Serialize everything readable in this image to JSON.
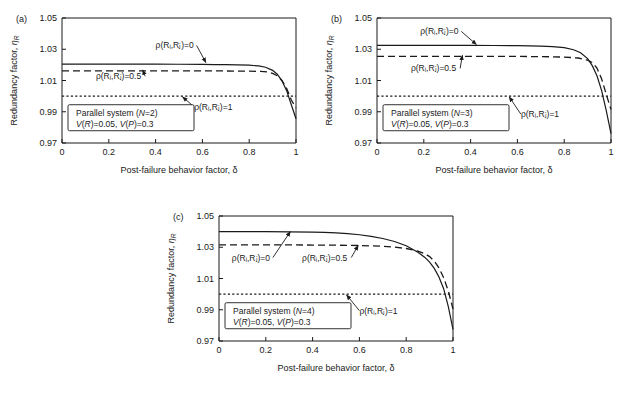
{
  "figure": {
    "background": "#ffffff",
    "ink": "#1a1a1a"
  },
  "axes": {
    "xlabel": "Post-failure behavior factor, δ",
    "ylabel_main": "Redundancy factor, ",
    "ylabel_symbol": "η",
    "ylabel_subscript": "R",
    "xticks": [
      "0",
      "0.2",
      "0.4",
      "0.6",
      "0.8",
      "1"
    ],
    "xtick_values": [
      0,
      0.2,
      0.4,
      0.6,
      0.8,
      1
    ],
    "yticks": [
      "0.97",
      "0.99",
      "1.01",
      "1.03",
      "1.05"
    ],
    "ytick_values": [
      0.97,
      0.99,
      1.01,
      1.03,
      1.05
    ],
    "xlim": [
      0,
      1
    ],
    "ylim": [
      0.97,
      1.05
    ]
  },
  "labels": {
    "rho0": "ρ(Rᵢ,Rⱼ)=0",
    "rho05": "ρ(Rᵢ,Rⱼ)=0.5",
    "rho1": "ρ(Rᵢ,Rⱼ)=1"
  },
  "chart_data": [
    {
      "type": "line",
      "panel": "(a)",
      "title": "",
      "xlabel": "Post-failure behavior factor, δ",
      "ylabel": "Redundancy factor, ηR",
      "xlim": [
        0,
        1
      ],
      "ylim": [
        0.97,
        1.05
      ],
      "grid": false,
      "legend_position": "lower-left-box",
      "legend_lines": [
        "Parallel system (N=2)",
        "V(R)=0.05,  V(P)=0.3"
      ],
      "legend_line1_pre": "Parallel system (",
      "legend_line1_var": "N",
      "legend_line1_post": "=2)",
      "legend_line2_a": "V",
      "legend_line2_b": "(",
      "legend_line2_c": "R",
      "legend_line2_d": ")=0.05,  ",
      "legend_line2_e": "V",
      "legend_line2_f": "(",
      "legend_line2_g": "P",
      "legend_line2_h": ")=0.3",
      "series": [
        {
          "name": "ρ(Ri,Rj)=0",
          "style": "solid",
          "x": [
            0,
            0.1,
            0.2,
            0.3,
            0.4,
            0.5,
            0.6,
            0.65,
            0.7,
            0.75,
            0.8,
            0.84,
            0.87,
            0.9,
            0.92,
            0.94,
            0.96,
            0.98,
            1.0
          ],
          "y": [
            1.0205,
            1.0205,
            1.0205,
            1.0205,
            1.0205,
            1.0204,
            1.0203,
            1.0202,
            1.0201,
            1.02,
            1.0198,
            1.0193,
            1.0185,
            1.0165,
            1.014,
            1.0098,
            1.0035,
            0.9945,
            0.9855
          ]
        },
        {
          "name": "ρ(Ri,Rj)=0.5",
          "style": "dashed",
          "x": [
            0,
            0.1,
            0.2,
            0.3,
            0.4,
            0.5,
            0.6,
            0.7,
            0.8,
            0.85,
            0.88,
            0.9,
            0.92,
            0.94,
            0.96,
            0.98,
            1.0
          ],
          "y": [
            1.0162,
            1.0162,
            1.0162,
            1.0162,
            1.0162,
            1.0162,
            1.0161,
            1.0161,
            1.016,
            1.0158,
            1.0154,
            1.0146,
            1.013,
            1.01,
            1.005,
            0.9975,
            0.9925
          ]
        },
        {
          "name": "ρ(Ri,Rj)=1",
          "style": "dotted",
          "x": [
            0,
            1
          ],
          "y": [
            1.0,
            1.0
          ]
        }
      ],
      "annotations": [
        {
          "text": "ρ(Rᵢ,Rⱼ)=0",
          "tx": 0.4,
          "ty": 1.0305,
          "ax": 0.615,
          "ay": 1.0215
        },
        {
          "text": "ρ(Rᵢ,Rⱼ)=0.5",
          "tx": 0.145,
          "ty": 1.0108,
          "ax": 0.345,
          "ay": 1.0168
        },
        {
          "text": "ρ(Rᵢ,Rⱼ)=1",
          "tx": 0.565,
          "ty": 0.9912,
          "ax": 0.515,
          "ay": 0.9995
        }
      ]
    },
    {
      "type": "line",
      "panel": "(b)",
      "title": "",
      "xlabel": "Post-failure behavior factor, δ",
      "ylabel": "Redundancy factor, ηR",
      "xlim": [
        0,
        1
      ],
      "ylim": [
        0.97,
        1.05
      ],
      "grid": false,
      "legend_position": "lower-left-box",
      "legend_lines": [
        "Parallel system (N=3)",
        "V(R)=0.05,  V(P)=0.3"
      ],
      "legend_line1_pre": "Parallel system (",
      "legend_line1_var": "N",
      "legend_line1_post": "=3)",
      "legend_line2_a": "V",
      "legend_line2_b": "(",
      "legend_line2_c": "R",
      "legend_line2_d": ")=0.05,  ",
      "legend_line2_e": "V",
      "legend_line2_f": "(",
      "legend_line2_g": "P",
      "legend_line2_h": ")=0.3",
      "series": [
        {
          "name": "ρ(Ri,Rj)=0",
          "style": "solid",
          "x": [
            0,
            0.1,
            0.2,
            0.3,
            0.4,
            0.5,
            0.6,
            0.7,
            0.75,
            0.8,
            0.84,
            0.87,
            0.9,
            0.92,
            0.94,
            0.96,
            0.98,
            1.0
          ],
          "y": [
            1.0325,
            1.0325,
            1.0325,
            1.0325,
            1.0325,
            1.0324,
            1.0323,
            1.032,
            1.0317,
            1.031,
            1.0297,
            1.0278,
            1.024,
            1.0195,
            1.013,
            1.0035,
            0.9905,
            0.976
          ]
        },
        {
          "name": "ρ(Ri,Rj)=0.5",
          "style": "dashed",
          "x": [
            0,
            0.1,
            0.2,
            0.3,
            0.4,
            0.5,
            0.6,
            0.7,
            0.8,
            0.86,
            0.9,
            0.92,
            0.94,
            0.96,
            0.98,
            1.0
          ],
          "y": [
            1.0255,
            1.0255,
            1.0255,
            1.0255,
            1.0255,
            1.0255,
            1.0254,
            1.0253,
            1.025,
            1.0244,
            1.023,
            1.0215,
            1.018,
            1.011,
            1.001,
            0.9915
          ]
        },
        {
          "name": "ρ(Ri,Rj)=1",
          "style": "dotted",
          "x": [
            0,
            1
          ],
          "y": [
            1.0,
            1.0
          ]
        }
      ],
      "annotations": [
        {
          "text": "ρ(Rᵢ,Rⱼ)=0",
          "tx": 0.185,
          "ty": 1.0395,
          "ax": 0.425,
          "ay": 1.033
        },
        {
          "text": "ρ(Rᵢ,Rⱼ)=0.5",
          "tx": 0.145,
          "ty": 1.0158,
          "ax": 0.365,
          "ay": 1.0262
        },
        {
          "text": "ρ(Rᵢ,Rⱼ)=1",
          "tx": 0.615,
          "ty": 0.9865,
          "ax": 0.565,
          "ay": 0.9995
        }
      ]
    },
    {
      "type": "line",
      "panel": "(c)",
      "title": "",
      "xlabel": "Post-failure behavior factor, δ",
      "ylabel": "Redundancy factor, ηR",
      "xlim": [
        0,
        1
      ],
      "ylim": [
        0.97,
        1.05
      ],
      "grid": false,
      "legend_position": "lower-left-box",
      "legend_lines": [
        "Parallel system (N=4)",
        "V(R)=0.05,  V(P)=0.3"
      ],
      "legend_line1_pre": "Parallel system (",
      "legend_line1_var": "N",
      "legend_line1_post": "=4)",
      "legend_line2_a": "V",
      "legend_line2_b": "(",
      "legend_line2_c": "R",
      "legend_line2_d": ")=0.05,  ",
      "legend_line2_e": "V",
      "legend_line2_f": "(",
      "legend_line2_g": "P",
      "legend_line2_h": ")=0.3",
      "series": [
        {
          "name": "ρ(Ri,Rj)=0",
          "style": "solid",
          "x": [
            0,
            0.1,
            0.2,
            0.3,
            0.4,
            0.45,
            0.5,
            0.55,
            0.6,
            0.65,
            0.7,
            0.75,
            0.8,
            0.85,
            0.88,
            0.9,
            0.92,
            0.94,
            0.96,
            0.98,
            1.0
          ],
          "y": [
            1.04,
            1.04,
            1.04,
            1.0399,
            1.0397,
            1.0395,
            1.0392,
            1.0387,
            1.038,
            1.037,
            1.0356,
            1.0337,
            1.031,
            1.0268,
            1.0235,
            1.0205,
            1.0165,
            1.011,
            1.0035,
            0.992,
            0.9775
          ]
        },
        {
          "name": "ρ(Ri,Rj)=0.5",
          "style": "dashed",
          "x": [
            0,
            0.1,
            0.2,
            0.3,
            0.4,
            0.5,
            0.6,
            0.65,
            0.7,
            0.75,
            0.8,
            0.85,
            0.88,
            0.9,
            0.92,
            0.94,
            0.96,
            0.98,
            1.0
          ],
          "y": [
            1.0315,
            1.0315,
            1.0315,
            1.0315,
            1.0314,
            1.0313,
            1.0311,
            1.0309,
            1.0306,
            1.0301,
            1.0292,
            1.0275,
            1.0258,
            1.024,
            1.0212,
            1.0168,
            1.0105,
            1.002,
            0.9905
          ]
        },
        {
          "name": "ρ(Ri,Rj)=1",
          "style": "dotted",
          "x": [
            0,
            1
          ],
          "y": [
            1.0,
            1.0
          ]
        }
      ],
      "annotations": [
        {
          "text": "ρ(Rᵢ,Rⱼ)=0",
          "tx": 0.055,
          "ty": 1.0215,
          "ax": 0.305,
          "ay": 1.04
        },
        {
          "text": "ρ(Rᵢ,Rⱼ)=0.5",
          "tx": 0.355,
          "ty": 1.0215,
          "ax": 0.595,
          "ay": 1.0312
        },
        {
          "text": "ρ(Rᵢ,Rⱼ)=1",
          "tx": 0.6,
          "ty": 0.9875,
          "ax": 0.545,
          "ay": 0.9995
        }
      ]
    }
  ]
}
